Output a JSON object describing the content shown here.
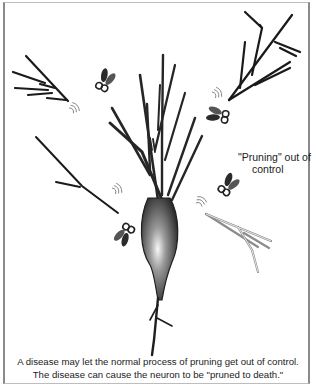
{
  "figure": {
    "annotation": {
      "line1": "\"Pruning\" out of",
      "line2": "control"
    },
    "caption": {
      "line1": "A disease may let the normal process of pruning get out of control.",
      "line2": "The disease can cause the neuron to be \"pruned to death.\""
    },
    "elements": {
      "neuron": "neuron-with-dendrites",
      "scissors_count": 5,
      "cut_branches": 4,
      "snip_marks": 5
    },
    "colors": {
      "branch": "#1a1a1a",
      "soma_highlight": "#f5f5f5",
      "soma_dark": "#2a2a2a",
      "frame": "#8a8a8a",
      "faded_branch": "#9a9a9a"
    }
  }
}
